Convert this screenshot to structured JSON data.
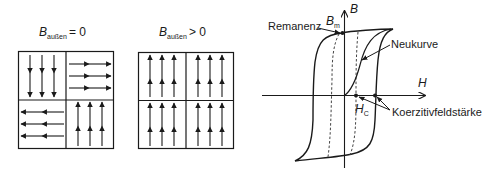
{
  "panels": {
    "left": {
      "label_main": "B",
      "label_sub": "außen",
      "label_rel": "= 0",
      "domains": [
        "down",
        "right",
        "left",
        "up"
      ]
    },
    "middle": {
      "label_main": "B",
      "label_sub": "außen",
      "label_rel": "> 0",
      "domains": [
        "up",
        "up",
        "up",
        "up"
      ]
    }
  },
  "hysteresis": {
    "axis_y_label": "B",
    "axis_x_label": "H",
    "bm_main": "B",
    "bm_sub": "m",
    "hc_main": "H",
    "hc_sub": "C",
    "annotations": {
      "remanenz": "Remanenz",
      "neukurve": "Neukurve",
      "koerzitiv": "Koerzitivfeldstärke"
    }
  },
  "colors": {
    "line": "#1a1a1a",
    "dashed": "#444444",
    "background": "#ffffff"
  }
}
